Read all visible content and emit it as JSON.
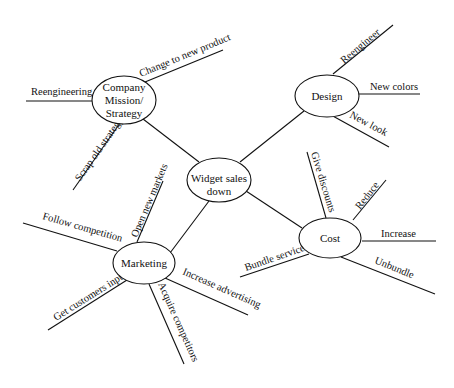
{
  "diagram": {
    "type": "mind map / fishbone-style cause diagram",
    "center": {
      "id": "widget",
      "label_lines": [
        "Widget sales",
        "down"
      ]
    },
    "nodes": [
      {
        "id": "mission",
        "label_lines": [
          "Company",
          "Mission/",
          "Strategy"
        ],
        "branches": [
          "Reengineering",
          "Change to new product",
          "Scrap old strategy"
        ]
      },
      {
        "id": "design",
        "label_lines": [
          "Design"
        ],
        "branches": [
          "Reengineer",
          "New colors",
          "New look"
        ]
      },
      {
        "id": "cost",
        "label_lines": [
          "Cost"
        ],
        "branches": [
          "Give discounts",
          "Reduce",
          "Increase",
          "Unbundle",
          "Bundle service"
        ]
      },
      {
        "id": "marketing",
        "label_lines": [
          "Marketing"
        ],
        "branches": [
          "Open new markets",
          "Follow competition",
          "Get customers input",
          "Acquire competitors",
          "Increase advertising"
        ]
      }
    ],
    "colors": {
      "line": "#111111",
      "background": "#ffffff",
      "text": "#111111"
    }
  }
}
